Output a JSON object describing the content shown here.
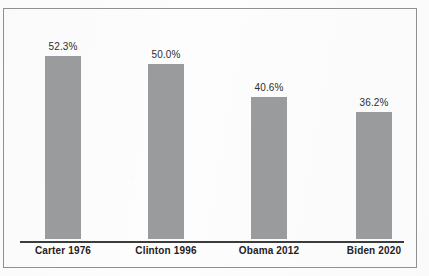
{
  "page": {
    "top_bleed_text": "—"
  },
  "chart_data": {
    "type": "bar",
    "title": "",
    "subtitle": "",
    "xlabel": "",
    "ylabel": "",
    "ylim": [
      0,
      60
    ],
    "grid": false,
    "legend": null,
    "axis": {
      "baseline_visible": true,
      "y_axis_visible": false,
      "ticks": []
    },
    "bar_color": "#9a9b9c",
    "frame_color": "#8e9092",
    "background": "#fdfdfd",
    "value_suffix": "%",
    "categories": [
      "Carter 1976",
      "Clinton 1996",
      "Obama 2012",
      "Biden 2020"
    ],
    "values": [
      52.3,
      50.0,
      40.6,
      36.2
    ],
    "labels": [
      "52.3%",
      "50.0%",
      "40.6%",
      "36.2%"
    ],
    "points": [
      {
        "category": "Carter 1976",
        "value": 52.3,
        "label": "52.3%"
      },
      {
        "category": "Clinton 1996",
        "value": 50.0,
        "label": "50.0%"
      },
      {
        "category": "Obama 2012",
        "value": 40.6,
        "label": "40.6%"
      },
      {
        "category": "Biden 2020",
        "value": 36.2,
        "label": "36.2%"
      }
    ]
  },
  "watermark": {
    "text": ""
  }
}
